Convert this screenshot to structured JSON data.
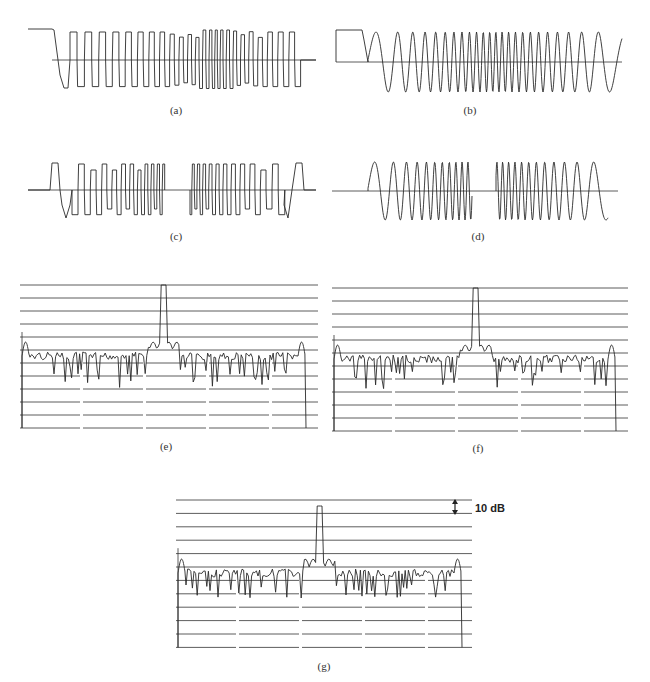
{
  "figure": {
    "panels": [
      {
        "id": "a",
        "label": "(a)",
        "kind": "square-wave time signal (quantized)"
      },
      {
        "id": "b",
        "label": "(b)",
        "kind": "filtered time signal"
      },
      {
        "id": "c",
        "label": "(c)",
        "kind": "square-wave time signal (two bursts)"
      },
      {
        "id": "d",
        "label": "(d)",
        "kind": "filtered time signal (two bursts)"
      },
      {
        "id": "e",
        "label": "(e)",
        "kind": "spectrum"
      },
      {
        "id": "f",
        "label": "(f)",
        "kind": "spectrum"
      },
      {
        "id": "g",
        "label": "(g)",
        "kind": "spectrum"
      }
    ],
    "scale_annotation": "10 dB",
    "stroke_color": "#2a2a2a",
    "grid_color": "#333333"
  },
  "chart_data": [
    {
      "panel": "a",
      "type": "line",
      "title": "(a)",
      "xlabel": "",
      "ylabel": "",
      "description": "Rectangular pulse train, amplitude steps, dense burst in centre"
    },
    {
      "panel": "b",
      "type": "line",
      "title": "(b)",
      "xlabel": "",
      "ylabel": "",
      "description": "Sinusoidal chirp-like waveform, frequency increasing toward centre then decreasing"
    },
    {
      "panel": "c",
      "type": "line",
      "title": "(c)",
      "xlabel": "",
      "ylabel": "",
      "description": "Rectangular pulse train in two bursts separated by a gap"
    },
    {
      "panel": "d",
      "type": "line",
      "title": "(d)",
      "xlabel": "",
      "ylabel": "",
      "description": "Sinusoidal waveform in two bursts separated by a gap"
    },
    {
      "panel": "e",
      "type": "line",
      "title": "(e)",
      "grid": true,
      "gridlines": 12,
      "grid_step_db": 10,
      "peak": "central spike reaching top gridline",
      "sidelobe_level_gridline": 4,
      "description": "Spectrum with main lobes at edges, noisy floor ~4 gridlines below top"
    },
    {
      "panel": "f",
      "type": "line",
      "title": "(f)",
      "grid": true,
      "gridlines": 12,
      "grid_step_db": 10,
      "peak": "central spike reaching top gridline",
      "description": "Spectrum, similar to (e) with deeper nulls"
    },
    {
      "panel": "g",
      "type": "line",
      "title": "(g)",
      "grid": true,
      "gridlines": 12,
      "grid_step_db": 10,
      "peak": "central spike reaching ~2nd gridline",
      "annotation": "10 dB",
      "description": "Spectrum with smoother noise floor"
    }
  ]
}
